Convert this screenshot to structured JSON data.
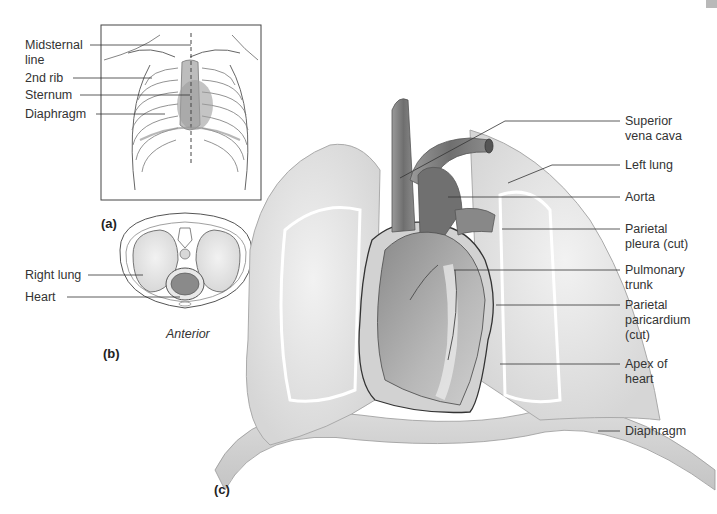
{
  "figure": {
    "panels": [
      {
        "id": "a",
        "letter": "(a)",
        "labels": [
          {
            "text": "Midsternal\nline"
          },
          {
            "text": "2nd rib"
          },
          {
            "text": "Sternum"
          },
          {
            "text": "Diaphragm"
          }
        ]
      },
      {
        "id": "b",
        "letter": "(b)",
        "orientation_label": "Anterior",
        "labels": [
          {
            "text": "Right lung"
          },
          {
            "text": "Heart"
          }
        ]
      },
      {
        "id": "c",
        "letter": "(c)",
        "labels": [
          {
            "text": "Superior\nvena cava"
          },
          {
            "text": "Left lung"
          },
          {
            "text": "Aorta"
          },
          {
            "text": "Parietal\npleura (cut)"
          },
          {
            "text": "Pulmonary\ntrunk"
          },
          {
            "text": "Parietal\nparicardium\n(cut)"
          },
          {
            "text": "Apex of\nheart"
          },
          {
            "text": "Diaphragm"
          }
        ]
      }
    ],
    "colors": {
      "background": "#ffffff",
      "tissue_light": "#e6e6e6",
      "tissue_mid": "#b5b5b5",
      "vessel_dark": "#6e6e6e",
      "line": "#333333"
    }
  }
}
